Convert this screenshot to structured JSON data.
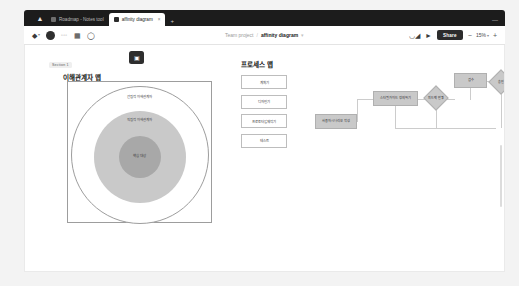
{
  "browser": {
    "home_icon": "home-icon",
    "tabs": [
      {
        "label": "Roadmap - Notes tool",
        "favicon": "page-icon",
        "active": false
      },
      {
        "label": "affinity diagram",
        "favicon": "file-icon",
        "active": true,
        "close": "×"
      }
    ],
    "new_tab": "+",
    "minimize": "—"
  },
  "toolbar": {
    "menu_icon": "figma-menu-icon",
    "menu_caret": "▾",
    "avatar": "user-avatar",
    "tools_label": "▫▫▫",
    "frame_icon": "frame-icon",
    "comment_icon": "comment-icon",
    "breadcrumb_project": "Team project",
    "breadcrumb_sep": "/",
    "breadcrumb_file": "affinity diagram",
    "breadcrumb_caret": "▾",
    "headphones_icon": "headphones-icon",
    "present_icon": "present-icon",
    "share_label": "Share",
    "zoom_minus": "−",
    "zoom_value": "15%",
    "zoom_caret": "▾",
    "zoom_plus": "+"
  },
  "canvas": {
    "section1": {
      "badge": "Section 1",
      "title": "이해관계자 맵",
      "icon_button": "image-icon",
      "rings": [
        {
          "label": "간접적 이해관계자"
        },
        {
          "label": "직접적 이해관계자"
        },
        {
          "label": "핵심 대상"
        }
      ]
    },
    "section2": {
      "title": "프로세스 맵",
      "steps": [
        {
          "label": "계획기"
        },
        {
          "label": "디자인기"
        },
        {
          "label": "프로토타입 제작기"
        },
        {
          "label": "테스트"
        }
      ],
      "flow_nodes": [
        {
          "id": "n1",
          "label": "사용자 시나리오 작성",
          "shape": "box"
        },
        {
          "id": "n2",
          "label": "스타일가이드 정의하기",
          "shape": "box"
        },
        {
          "id": "d1",
          "label": "피드백 반영",
          "shape": "diamond"
        },
        {
          "id": "n3",
          "label": "검수",
          "shape": "box"
        },
        {
          "id": "d2",
          "label": "승인",
          "shape": "diamond"
        }
      ]
    }
  }
}
